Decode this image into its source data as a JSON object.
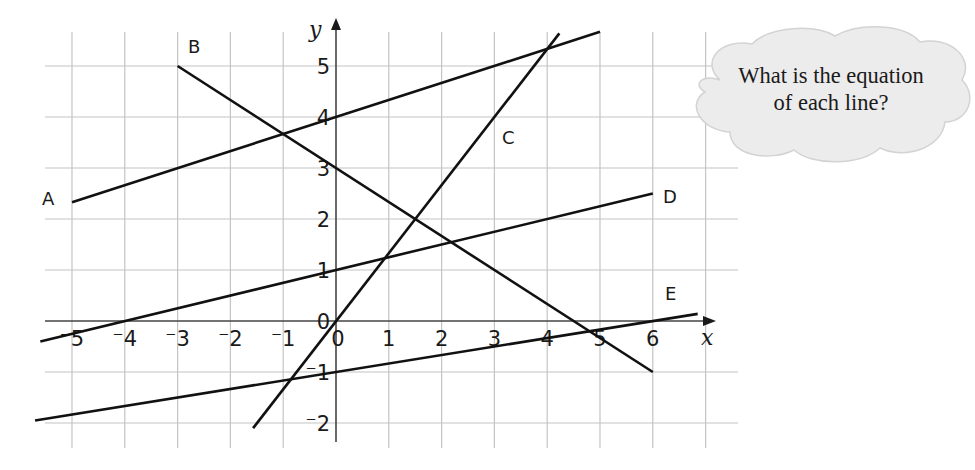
{
  "question": {
    "line1": "What is the equation",
    "line2": "of each line?"
  },
  "chart_data": {
    "type": "line",
    "title": "",
    "xlabel": "x",
    "ylabel": "y",
    "xlim": [
      -5.5,
      7.5
    ],
    "ylim": [
      -2.4,
      5.7
    ],
    "grid": true,
    "x_ticks": [
      -5,
      -4,
      -3,
      -2,
      -1,
      0,
      1,
      2,
      3,
      4,
      5,
      6
    ],
    "x_tick_labels": [
      "⁻5",
      "⁻4",
      "⁻3",
      "⁻2",
      "⁻1",
      "0",
      "1",
      "2",
      "3",
      "4",
      "5",
      "6"
    ],
    "y_ticks": [
      -2,
      -1,
      0,
      1,
      2,
      3,
      4,
      5
    ],
    "y_tick_labels": [
      "⁻2",
      "⁻1",
      "0",
      "1",
      "2",
      "3",
      "4",
      "5"
    ],
    "series": [
      {
        "name": "A",
        "equation": "y = x/3 + 4",
        "x": [
          -5,
          5
        ],
        "y": [
          2.33,
          5.67
        ]
      },
      {
        "name": "B",
        "equation": "y = -2x/3 + 3",
        "x": [
          -3,
          6
        ],
        "y": [
          5,
          -1
        ]
      },
      {
        "name": "C",
        "equation": "y = 4x/3",
        "x": [
          -1.57,
          4.23
        ],
        "y": [
          -2.1,
          5.64
        ]
      },
      {
        "name": "D",
        "equation": "y = x/4 + 1",
        "x": [
          -5.6,
          6
        ],
        "y": [
          -0.4,
          2.5
        ]
      },
      {
        "name": "E",
        "equation": "y = x/6 - 1",
        "x": [
          -5.7,
          6.85
        ],
        "y": [
          -1.95,
          0.14
        ]
      }
    ],
    "annotations": [
      "What is the equation of each line?"
    ]
  },
  "labels": {
    "A": "A",
    "B": "B",
    "C": "C",
    "D": "D",
    "E": "E",
    "x_axis": "x",
    "y_axis": "y"
  }
}
